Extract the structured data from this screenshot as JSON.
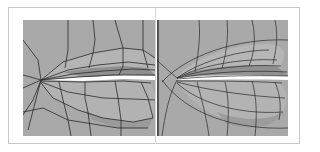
{
  "figure": {
    "panels": [
      {
        "id": "left",
        "label": "low-poly lip mesh",
        "style": "faceted polygon wireframe"
      },
      {
        "id": "right",
        "label": "smoothed lip mesh",
        "style": "subdivided curved wireframe"
      }
    ],
    "colors": {
      "background": "#ffffff",
      "surface": "#a9a9a9",
      "surface_light": "#b9b9b9",
      "surface_dark": "#8e8e8e",
      "wire": "#2a2a2a",
      "frame": "#c8c8c8"
    }
  }
}
